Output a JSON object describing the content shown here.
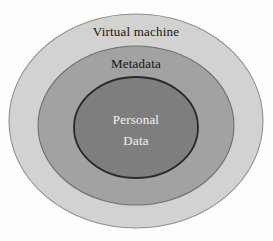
{
  "figure": {
    "name": "concentric-data-layers",
    "type": "nested-ellipse-diagram",
    "background_color": "#fdfdfc",
    "layers": [
      {
        "id": "virtual-machine",
        "label": "Virtual machine",
        "fill": "#d2d2d0",
        "stroke": "#8f8f8d",
        "text_color": "#17150f",
        "level": 1
      },
      {
        "id": "metadata",
        "label": "Metadata",
        "fill": "#a2a2a0",
        "stroke": "#6e6e6c",
        "text_color": "#17150f",
        "level": 2
      },
      {
        "id": "personal-data",
        "label_line1": "Personal",
        "label_line2": "Data",
        "fill": "#7e7e7c",
        "stroke": "#2a2a28",
        "text_color": "#f4f4f2",
        "level": 3
      }
    ]
  }
}
